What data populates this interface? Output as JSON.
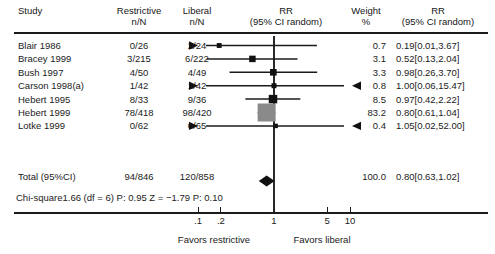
{
  "header": {
    "study": "Study",
    "restrictive": "Restrictive\nn/N",
    "restrictive_l1": "Restrictive",
    "restrictive_l2": "n/N",
    "liberal_l1": "Liberal",
    "liberal_l2": "n/N",
    "rr_plot_l1": "RR",
    "rr_plot_l2": "(95% CI random)",
    "weight_l1": "Weight",
    "weight_l2": "%",
    "rr_val_l1": "RR",
    "rr_val_l2": "(95% CI random)"
  },
  "statistics": {
    "chi_square_line": "Chi-square1.66 (df = 6) P: 0.95 Z = −1.79 P: 0.10",
    "chi_square": 1.66,
    "df": 6,
    "p_heterogeneity": 0.95,
    "z": -1.79,
    "p_overall": 0.1
  },
  "axis": {
    "ticks": [
      ".1",
      ".2",
      "1",
      "5",
      "10"
    ],
    "tick_values": [
      0.1,
      0.2,
      1,
      5,
      10
    ],
    "left_footer": "Favors restrictive",
    "right_footer": "Favors liberal"
  },
  "chart_data": {
    "type": "forest",
    "title": "",
    "xlabel": "RR (95% CI random)",
    "ylabel": "",
    "xscale": "log",
    "xlim": [
      0.06,
      60
    ],
    "null_value": 1,
    "grid": false,
    "columns": [
      "Study",
      "Restrictive n/N",
      "Liberal n/N",
      "RR (95% CI random)",
      "Weight %",
      "RR (95% CI random)"
    ],
    "rows": [
      {
        "study": "Blair 1986",
        "restrictive": "0/26",
        "liberal": "2/24",
        "weight": "0.7",
        "weight_value": 0.7,
        "rr_text": "0.19[0.01,3.67]",
        "rr": 0.19,
        "ci_low": 0.01,
        "ci_high": 3.67,
        "arrow_left": true,
        "arrow_right": false
      },
      {
        "study": "Bracey 1999",
        "restrictive": "3/215",
        "liberal": "6/222",
        "weight": "3.1",
        "weight_value": 3.1,
        "rr_text": "0.52[0.13,2.04]",
        "rr": 0.52,
        "ci_low": 0.13,
        "ci_high": 2.04,
        "arrow_left": false,
        "arrow_right": false
      },
      {
        "study": "Bush 1997",
        "restrictive": "4/50",
        "liberal": "4/49",
        "weight": "3.3",
        "weight_value": 3.3,
        "rr_text": "0.98[0.26,3.70]",
        "rr": 0.98,
        "ci_low": 0.26,
        "ci_high": 3.7,
        "arrow_left": false,
        "arrow_right": false
      },
      {
        "study": "Carson 1998(a)",
        "restrictive": "1/42",
        "liberal": "1/42",
        "weight": "0.8",
        "weight_value": 0.8,
        "rr_text": "1.00[0.06,15.47]",
        "rr": 1.0,
        "ci_low": 0.06,
        "ci_high": 15.47,
        "arrow_left": true,
        "arrow_right": true
      },
      {
        "study": "Hebert 1995",
        "restrictive": "8/33",
        "liberal": "9/36",
        "weight": "8.5",
        "weight_value": 8.5,
        "rr_text": "0.97[0.42,2.22]",
        "rr": 0.97,
        "ci_low": 0.42,
        "ci_high": 2.22,
        "arrow_left": false,
        "arrow_right": false
      },
      {
        "study": "Hebert 1999",
        "restrictive": "78/418",
        "liberal": "98/420",
        "weight": "83.2",
        "weight_value": 83.2,
        "rr_text": "0.80[0.61,1.04]",
        "rr": 0.8,
        "ci_low": 0.61,
        "ci_high": 1.04,
        "arrow_left": false,
        "arrow_right": false
      },
      {
        "study": "Lotke 1999",
        "restrictive": "0/62",
        "liberal": "0/65",
        "weight": "0.4",
        "weight_value": 0.4,
        "rr_text": "1.05[0.02,52.00]",
        "rr": 1.05,
        "ci_low": 0.02,
        "ci_high": 52.0,
        "arrow_left": true,
        "arrow_right": true
      }
    ],
    "total": {
      "study": "Total (95%CI)",
      "restrictive": "94/846",
      "liberal": "120/858",
      "weight": "100.0",
      "weight_value": 100.0,
      "rr_text": "0.80[0.63,1.02]",
      "rr": 0.8,
      "ci_low": 0.63,
      "ci_high": 1.02
    }
  },
  "colors": {
    "ink": "#1b1b1b",
    "marker": "#111111",
    "big_marker": "#8a8a8a",
    "diamond": "#111111"
  }
}
